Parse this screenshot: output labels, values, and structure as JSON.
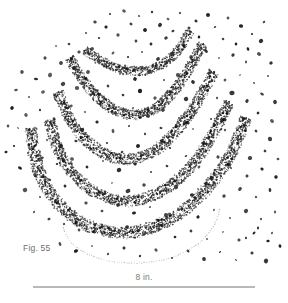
{
  "figure": {
    "caption": "Fig. 55",
    "scale_label": "8 in.",
    "colors": {
      "background": "#ffffff",
      "stipple": "#2b2b2b",
      "speck": "#1f1f1f",
      "outline_dots": "#a9a9a9",
      "caption_text": "#6d6d6d",
      "scale_text": "#7a7a7a",
      "scale_rule": "#b9b9b9"
    },
    "arc_count": 5
  },
  "chart_data": {
    "type": "scatter",
    "title": "Fig. 55",
    "xlabel": "",
    "ylabel": "",
    "scale_bar": {
      "label": "8 in.",
      "length_px": 222,
      "x_start": 33,
      "x_end": 255,
      "y": 286
    },
    "xlim": [
      0,
      288
    ],
    "ylim": [
      0,
      303
    ],
    "grid": false,
    "legend": "none",
    "annotations": [
      "Fig. 55",
      "8 in."
    ],
    "series": [
      {
        "name": "arc-band-1",
        "kind": "stippled-band",
        "thickness": 9,
        "density": 0.72,
        "path": [
          [
            85,
            50
          ],
          [
            95,
            57
          ],
          [
            107,
            64
          ],
          [
            120,
            69
          ],
          [
            134,
            71
          ],
          [
            148,
            70
          ],
          [
            161,
            65
          ],
          [
            173,
            56
          ],
          [
            183,
            43
          ],
          [
            190,
            31
          ]
        ]
      },
      {
        "name": "arc-band-2",
        "kind": "stippled-band",
        "thickness": 10,
        "density": 0.75,
        "path": [
          [
            70,
            58
          ],
          [
            79,
            74
          ],
          [
            90,
            89
          ],
          [
            103,
            102
          ],
          [
            117,
            111
          ],
          [
            132,
            115
          ],
          [
            147,
            112
          ],
          [
            161,
            104
          ],
          [
            174,
            91
          ],
          [
            186,
            74
          ],
          [
            196,
            56
          ],
          [
            203,
            44
          ]
        ]
      },
      {
        "name": "arc-band-3",
        "kind": "stippled-band",
        "thickness": 11,
        "density": 0.78,
        "path": [
          [
            58,
            92
          ],
          [
            65,
            110
          ],
          [
            75,
            127
          ],
          [
            88,
            142
          ],
          [
            103,
            153
          ],
          [
            120,
            159
          ],
          [
            137,
            158
          ],
          [
            154,
            151
          ],
          [
            169,
            139
          ],
          [
            183,
            123
          ],
          [
            196,
            104
          ],
          [
            206,
            86
          ],
          [
            214,
            72
          ]
        ]
      },
      {
        "name": "arc-band-4",
        "kind": "stippled-band",
        "thickness": 11,
        "density": 0.78,
        "path": [
          [
            50,
            120
          ],
          [
            55,
            141
          ],
          [
            64,
            161
          ],
          [
            77,
            178
          ],
          [
            93,
            191
          ],
          [
            111,
            199
          ],
          [
            130,
            201
          ],
          [
            149,
            197
          ],
          [
            167,
            188
          ],
          [
            184,
            174
          ],
          [
            199,
            156
          ],
          [
            212,
            136
          ],
          [
            222,
            117
          ],
          [
            229,
            102
          ]
        ]
      },
      {
        "name": "arc-band-5",
        "kind": "stippled-band",
        "thickness": 12,
        "density": 0.8,
        "path": [
          [
            31,
            128
          ],
          [
            34,
            152
          ],
          [
            41,
            176
          ],
          [
            53,
            197
          ],
          [
            69,
            214
          ],
          [
            89,
            226
          ],
          [
            111,
            232
          ],
          [
            134,
            232
          ],
          [
            156,
            226
          ],
          [
            177,
            215
          ],
          [
            196,
            200
          ],
          [
            213,
            181
          ],
          [
            228,
            159
          ],
          [
            239,
            136
          ],
          [
            246,
            118
          ]
        ]
      },
      {
        "name": "dotted-outline",
        "kind": "dotted-line",
        "path": [
          [
            63,
            228
          ],
          [
            70,
            241
          ],
          [
            82,
            251
          ],
          [
            98,
            258
          ],
          [
            117,
            262
          ],
          [
            137,
            263
          ],
          [
            158,
            261
          ],
          [
            178,
            255
          ],
          [
            195,
            246
          ],
          [
            208,
            234
          ],
          [
            216,
            221
          ],
          [
            220,
            209
          ]
        ]
      }
    ],
    "scatter_specks": [
      [
        110,
        14
      ],
      [
        124,
        11
      ],
      [
        139,
        16
      ],
      [
        152,
        12
      ],
      [
        168,
        19
      ],
      [
        180,
        13
      ],
      [
        196,
        21
      ],
      [
        208,
        15
      ],
      [
        95,
        22
      ],
      [
        106,
        27
      ],
      [
        131,
        24
      ],
      [
        145,
        30
      ],
      [
        160,
        25
      ],
      [
        173,
        31
      ],
      [
        189,
        28
      ],
      [
        215,
        27
      ],
      [
        228,
        18
      ],
      [
        241,
        26
      ],
      [
        252,
        34
      ],
      [
        264,
        22
      ],
      [
        86,
        33
      ],
      [
        99,
        38
      ],
      [
        118,
        35
      ],
      [
        136,
        41
      ],
      [
        151,
        44
      ],
      [
        166,
        38
      ],
      [
        183,
        45
      ],
      [
        199,
        37
      ],
      [
        223,
        39
      ],
      [
        236,
        44
      ],
      [
        248,
        49
      ],
      [
        261,
        41
      ],
      [
        56,
        46
      ],
      [
        69,
        44
      ],
      [
        79,
        52
      ],
      [
        92,
        49
      ],
      [
        113,
        53
      ],
      [
        128,
        57
      ],
      [
        142,
        52
      ],
      [
        158,
        59
      ],
      [
        172,
        54
      ],
      [
        191,
        57
      ],
      [
        206,
        51
      ],
      [
        219,
        58
      ],
      [
        233,
        55
      ],
      [
        246,
        62
      ],
      [
        259,
        54
      ],
      [
        271,
        63
      ],
      [
        45,
        58
      ],
      [
        61,
        63
      ],
      [
        74,
        68
      ],
      [
        88,
        72
      ],
      [
        104,
        66
      ],
      [
        120,
        74
      ],
      [
        135,
        79
      ],
      [
        149,
        72
      ],
      [
        164,
        80
      ],
      [
        178,
        75
      ],
      [
        193,
        82
      ],
      [
        209,
        73
      ],
      [
        225,
        80
      ],
      [
        240,
        75
      ],
      [
        254,
        83
      ],
      [
        268,
        76
      ],
      [
        22,
        72
      ],
      [
        36,
        79
      ],
      [
        50,
        75
      ],
      [
        63,
        84
      ],
      [
        77,
        88
      ],
      [
        93,
        93
      ],
      [
        108,
        86
      ],
      [
        123,
        95
      ],
      [
        140,
        91
      ],
      [
        155,
        98
      ],
      [
        170,
        92
      ],
      [
        186,
        99
      ],
      [
        201,
        91
      ],
      [
        217,
        98
      ],
      [
        232,
        93
      ],
      [
        247,
        101
      ],
      [
        262,
        94
      ],
      [
        275,
        102
      ],
      [
        16,
        90
      ],
      [
        29,
        97
      ],
      [
        43,
        92
      ],
      [
        57,
        101
      ],
      [
        71,
        106
      ],
      [
        85,
        112
      ],
      [
        100,
        104
      ],
      [
        116,
        113
      ],
      [
        133,
        108
      ],
      [
        148,
        116
      ],
      [
        163,
        110
      ],
      [
        179,
        118
      ],
      [
        195,
        111
      ],
      [
        211,
        119
      ],
      [
        227,
        112
      ],
      [
        243,
        120
      ],
      [
        258,
        113
      ],
      [
        272,
        121
      ],
      [
        12,
        108
      ],
      [
        26,
        115
      ],
      [
        40,
        110
      ],
      [
        54,
        119
      ],
      [
        68,
        124
      ],
      [
        82,
        130
      ],
      [
        97,
        122
      ],
      [
        113,
        131
      ],
      [
        129,
        126
      ],
      [
        145,
        134
      ],
      [
        161,
        128
      ],
      [
        177,
        136
      ],
      [
        193,
        129
      ],
      [
        209,
        137
      ],
      [
        225,
        130
      ],
      [
        241,
        138
      ],
      [
        256,
        131
      ],
      [
        270,
        139
      ],
      [
        18,
        128
      ],
      [
        33,
        134
      ],
      [
        47,
        140
      ],
      [
        61,
        146
      ],
      [
        76,
        141
      ],
      [
        91,
        149
      ],
      [
        107,
        143
      ],
      [
        122,
        152
      ],
      [
        138,
        146
      ],
      [
        154,
        154
      ],
      [
        170,
        148
      ],
      [
        186,
        156
      ],
      [
        202,
        149
      ],
      [
        218,
        157
      ],
      [
        234,
        150
      ],
      [
        250,
        158
      ],
      [
        265,
        151
      ],
      [
        278,
        159
      ],
      [
        14,
        146
      ],
      [
        28,
        153
      ],
      [
        42,
        158
      ],
      [
        57,
        164
      ],
      [
        72,
        159
      ],
      [
        87,
        167
      ],
      [
        103,
        161
      ],
      [
        119,
        170
      ],
      [
        135,
        164
      ],
      [
        151,
        172
      ],
      [
        167,
        166
      ],
      [
        183,
        174
      ],
      [
        199,
        167
      ],
      [
        215,
        175
      ],
      [
        231,
        168
      ],
      [
        247,
        176
      ],
      [
        262,
        169
      ],
      [
        276,
        177
      ],
      [
        20,
        168
      ],
      [
        35,
        175
      ],
      [
        50,
        180
      ],
      [
        65,
        186
      ],
      [
        80,
        181
      ],
      [
        96,
        189
      ],
      [
        112,
        183
      ],
      [
        128,
        191
      ],
      [
        144,
        185
      ],
      [
        160,
        193
      ],
      [
        176,
        187
      ],
      [
        192,
        195
      ],
      [
        208,
        188
      ],
      [
        224,
        196
      ],
      [
        240,
        189
      ],
      [
        256,
        197
      ],
      [
        270,
        190
      ],
      [
        25,
        190
      ],
      [
        40,
        197
      ],
      [
        55,
        202
      ],
      [
        70,
        208
      ],
      [
        86,
        203
      ],
      [
        102,
        211
      ],
      [
        118,
        205
      ],
      [
        134,
        213
      ],
      [
        150,
        207
      ],
      [
        166,
        215
      ],
      [
        182,
        209
      ],
      [
        198,
        217
      ],
      [
        214,
        210
      ],
      [
        230,
        218
      ],
      [
        246,
        211
      ],
      [
        261,
        219
      ],
      [
        275,
        212
      ],
      [
        34,
        212
      ],
      [
        49,
        219
      ],
      [
        64,
        224
      ],
      [
        79,
        230
      ],
      [
        95,
        225
      ],
      [
        111,
        233
      ],
      [
        127,
        227
      ],
      [
        143,
        235
      ],
      [
        159,
        229
      ],
      [
        175,
        237
      ],
      [
        191,
        231
      ],
      [
        207,
        239
      ],
      [
        223,
        232
      ],
      [
        239,
        240
      ],
      [
        254,
        233
      ],
      [
        268,
        241
      ],
      [
        60,
        244
      ],
      [
        76,
        251
      ],
      [
        92,
        246
      ],
      [
        108,
        254
      ],
      [
        124,
        248
      ],
      [
        140,
        256
      ],
      [
        156,
        250
      ],
      [
        172,
        258
      ],
      [
        188,
        251
      ],
      [
        204,
        259
      ],
      [
        220,
        252
      ],
      [
        236,
        260
      ],
      [
        252,
        253
      ],
      [
        266,
        261
      ],
      [
        246,
        238
      ],
      [
        258,
        228
      ],
      [
        272,
        233
      ],
      [
        280,
        246
      ],
      [
        8,
        126
      ],
      [
        6,
        152
      ]
    ]
  }
}
